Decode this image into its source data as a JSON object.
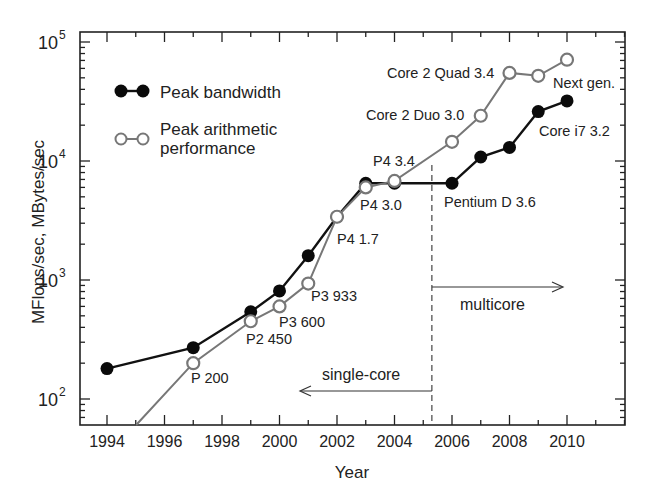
{
  "chart_data": {
    "type": "line",
    "title": "",
    "xlabel": "Year",
    "ylabel": "MFlops/sec, MBytes/sec",
    "yscale": "log",
    "xlim": [
      1993,
      2012
    ],
    "ylim": [
      60,
      120000
    ],
    "x_ticks": [
      1994,
      1996,
      1998,
      2000,
      2002,
      2004,
      2006,
      2008,
      2010
    ],
    "y_ticks": [
      {
        "base": "10",
        "exp": "2",
        "value": 100
      },
      {
        "base": "10",
        "exp": "3",
        "value": 1000
      },
      {
        "base": "10",
        "exp": "4",
        "value": 10000
      },
      {
        "base": "10",
        "exp": "5",
        "value": 100000
      }
    ],
    "grid": false,
    "legend": {
      "position": "upper-left",
      "entries": [
        {
          "label_lines": [
            "Peak bandwidth"
          ],
          "marker": "filled-circle",
          "color": "#111111"
        },
        {
          "label_lines": [
            "Peak arithmetic",
            "performance"
          ],
          "marker": "open-circle",
          "color": "#777777"
        }
      ]
    },
    "series": [
      {
        "name": "Peak bandwidth",
        "color": "#111111",
        "marker": "filled",
        "x": [
          1994,
          1997,
          1999,
          2000,
          2001,
          2002,
          2003,
          2004,
          2006,
          2007,
          2008,
          2009,
          2010
        ],
        "values": [
          180,
          270,
          540,
          810,
          1600,
          3400,
          6500,
          6500,
          6500,
          10800,
          13000,
          26000,
          32000
        ]
      },
      {
        "name": "Peak arithmetic performance",
        "color": "#777777",
        "marker": "open",
        "x": [
          1995,
          1997,
          1999,
          2000,
          2001,
          2002,
          2003,
          2004,
          2006,
          2007,
          2008,
          2009,
          2010
        ],
        "values": [
          60,
          200,
          450,
          600,
          933,
          3400,
          6000,
          6800,
          14500,
          24000,
          55000,
          52000,
          71000
        ],
        "marker_from_index": 1
      }
    ],
    "annotations": [
      {
        "text": "P 200",
        "x": 191,
        "y": 383,
        "anchor": "start"
      },
      {
        "text": "P2 450",
        "x": 246,
        "y": 344,
        "anchor": "start"
      },
      {
        "text": "P3 600",
        "x": 279,
        "y": 327,
        "anchor": "start"
      },
      {
        "text": "P3 933",
        "x": 311,
        "y": 301,
        "anchor": "start"
      },
      {
        "text": "P4 1.7",
        "x": 337,
        "y": 244,
        "anchor": "start"
      },
      {
        "text": "P4 3.0",
        "x": 360,
        "y": 210,
        "anchor": "start"
      },
      {
        "text": "P4 3.4",
        "x": 373,
        "y": 166,
        "anchor": "start"
      },
      {
        "text": "Pentium D 3.6",
        "x": 444,
        "y": 207,
        "anchor": "start"
      },
      {
        "text": "Core 2 Duo 3.0",
        "x": 366,
        "y": 120,
        "anchor": "start"
      },
      {
        "text": "Core 2 Quad 3.4",
        "x": 387,
        "y": 78,
        "anchor": "start"
      },
      {
        "text": "Next gen.",
        "x": 553,
        "y": 88,
        "anchor": "start"
      },
      {
        "text": "Core i7 3.2",
        "x": 539,
        "y": 136,
        "anchor": "start"
      }
    ],
    "regions": {
      "divider_year": 2005.3,
      "single_core_label": "single-core",
      "multicore_label": "multicore"
    }
  }
}
